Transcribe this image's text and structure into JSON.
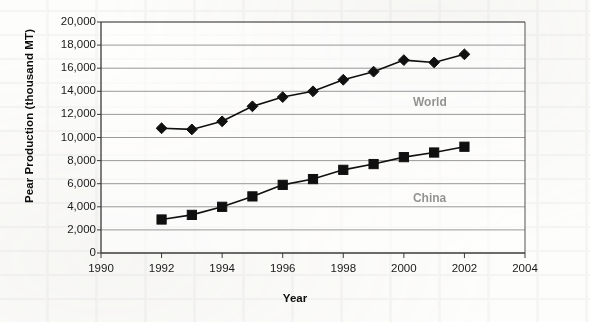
{
  "chart_data": {
    "type": "line",
    "title": "",
    "xlabel": "Year",
    "ylabel": "Pear Production (thousand MT)",
    "x": [
      1992,
      1993,
      1994,
      1995,
      1996,
      1997,
      1998,
      1999,
      2000,
      2001,
      2002
    ],
    "xlim": [
      1990,
      2004
    ],
    "ylim": [
      0,
      20000
    ],
    "xticks": [
      1990,
      1992,
      1994,
      1996,
      1998,
      2000,
      2002,
      2004
    ],
    "xtick_labels": [
      "1990",
      "1992",
      "1994",
      "1996",
      "1998",
      "2000",
      "2002",
      "2004"
    ],
    "yticks": [
      0,
      2000,
      4000,
      6000,
      8000,
      10000,
      12000,
      14000,
      16000,
      18000,
      20000
    ],
    "ytick_labels": [
      "0",
      "2,000",
      "4,000",
      "6,000",
      "8,000",
      "10,000",
      "12,000",
      "14,000",
      "16,000",
      "18,000",
      "20,000"
    ],
    "grid": "horizontal",
    "legend_position": "inline-annotation",
    "series": [
      {
        "name": "World",
        "marker": "diamond",
        "color": "#101010",
        "label_x": 2000.3,
        "label_y": 13000,
        "values": [
          10800,
          10700,
          11400,
          12700,
          13500,
          14000,
          15000,
          15700,
          16700,
          16500,
          17200
        ]
      },
      {
        "name": "China",
        "marker": "square",
        "color": "#101010",
        "label_x": 2000.3,
        "label_y": 4700,
        "values": [
          2900,
          3300,
          4000,
          4900,
          5900,
          6400,
          7200,
          7700,
          8300,
          8700,
          9200
        ]
      }
    ]
  },
  "axis": {
    "y_title": "Pear Production (thousand MT)",
    "x_title": "Year"
  },
  "annotations": {
    "world_label": "World",
    "china_label": "China"
  }
}
